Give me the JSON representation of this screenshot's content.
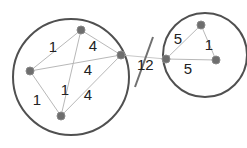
{
  "diagram": {
    "type": "clustered-weighted-graph",
    "clusters": [
      {
        "id": "left",
        "cx": 71,
        "cy": 77,
        "r": 58
      },
      {
        "id": "right",
        "cx": 205,
        "cy": 55,
        "r": 42
      }
    ],
    "nodes": [
      {
        "id": "A",
        "x": 81,
        "y": 30,
        "cluster": "left"
      },
      {
        "id": "B",
        "x": 30,
        "y": 71,
        "cluster": "left"
      },
      {
        "id": "C",
        "x": 121,
        "y": 55,
        "cluster": "left"
      },
      {
        "id": "D",
        "x": 61,
        "y": 116,
        "cluster": "left"
      },
      {
        "id": "E",
        "x": 166,
        "y": 59,
        "cluster": "right"
      },
      {
        "id": "F",
        "x": 201,
        "y": 25,
        "cluster": "right"
      },
      {
        "id": "G",
        "x": 216,
        "y": 60,
        "cluster": "right"
      }
    ],
    "edges": [
      {
        "from": "A",
        "to": "B",
        "weight": "1",
        "lx": 53,
        "ly": 48
      },
      {
        "from": "A",
        "to": "C",
        "weight": "4",
        "lx": 93,
        "ly": 47
      },
      {
        "from": "B",
        "to": "C",
        "weight": "4",
        "lx": 88,
        "ly": 71
      },
      {
        "from": "A",
        "to": "D",
        "weight": "1",
        "lx": 65,
        "ly": 91
      },
      {
        "from": "B",
        "to": "D",
        "weight": "1",
        "lx": 37,
        "ly": 101
      },
      {
        "from": "C",
        "to": "D",
        "weight": "4",
        "lx": 88,
        "ly": 96
      },
      {
        "from": "E",
        "to": "F",
        "weight": "5",
        "lx": 178,
        "ly": 40
      },
      {
        "from": "F",
        "to": "G",
        "weight": "1",
        "lx": 209,
        "ly": 46
      },
      {
        "from": "E",
        "to": "G",
        "weight": "5",
        "lx": 188,
        "ly": 70
      }
    ],
    "bridge": {
      "from": "C",
      "to": "E",
      "weight": "12",
      "lx": 137,
      "ly": 66,
      "cut_marker": true
    }
  }
}
